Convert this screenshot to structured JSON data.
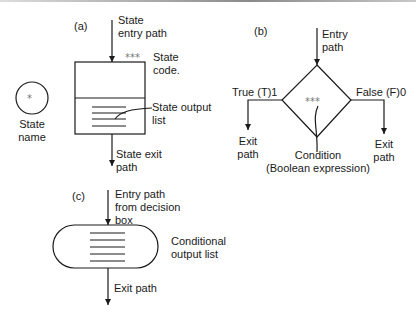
{
  "panels": {
    "a": {
      "label": "(a)",
      "entry": "State\nentry path",
      "code": "State\ncode.",
      "code_marker": "***",
      "output": "State output\nlist",
      "exit": "State exit\npath",
      "state_name": "State\nname",
      "state_marker": "*"
    },
    "b": {
      "label": "(b)",
      "entry": "Entry\npath",
      "true_branch": "True (T)1",
      "false_branch": "False (F)0",
      "marker": "***",
      "exit_left": "Exit\npath",
      "exit_right": "Exit\npath",
      "condition": "Condition\n(Boolean expression)"
    },
    "c": {
      "label": "(c)",
      "entry": "Entry path\nfrom decision\nbox",
      "output": "Conditional\noutput list",
      "exit": "Exit path"
    }
  },
  "colors": {
    "ink": "#1a1a1a",
    "marker": "#777777"
  }
}
